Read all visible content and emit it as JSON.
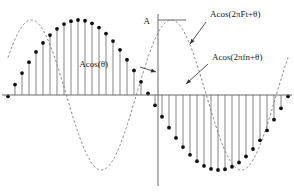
{
  "figure": {
    "title": "",
    "amplitude_label": "A",
    "labels": {
      "phase": "Acos(θ)",
      "continuous": "Acos(2πFt+θ)",
      "discrete": "Acos(2πfn+θ)"
    },
    "colors": {
      "axis": "#6b6b6b",
      "curve": "#777777",
      "stem": "#6f6f6f",
      "dot": "#111111",
      "leader": "#444444",
      "background": "#ffffff"
    }
  },
  "chart_data": {
    "type": "line",
    "title": "",
    "xlabel": "",
    "ylabel": "",
    "grid": false,
    "legend": false,
    "axes": {
      "x_axis_y_px": 95,
      "y_axis_x_px": 158,
      "amplitude_px": 75,
      "x_start_px": 8,
      "x_end_px": 288
    },
    "continuous": {
      "amplitude": 1.0,
      "cycles": 2.0,
      "phase_deg": -60,
      "n_points": 420
    },
    "samples": {
      "count": 41,
      "n": [
        -20,
        -19,
        -18,
        -17,
        -16,
        -15,
        -14,
        -13,
        -12,
        -11,
        -10,
        -9,
        -8,
        -7,
        -6,
        -5,
        -4,
        -3,
        -2,
        -1,
        0,
        1,
        2,
        3,
        4,
        5,
        6,
        7,
        8,
        9,
        10,
        11,
        12,
        13,
        14,
        15,
        16,
        17,
        18,
        19,
        20
      ],
      "values": [
        -0.017,
        0.139,
        0.292,
        0.438,
        0.574,
        0.695,
        0.799,
        0.883,
        0.946,
        0.985,
        1.0,
        0.99,
        0.956,
        0.899,
        0.819,
        0.719,
        0.602,
        0.47,
        0.327,
        0.176,
        0.02,
        -0.137,
        -0.29,
        -0.436,
        -0.573,
        -0.694,
        -0.798,
        -0.882,
        -0.945,
        -0.985,
        -1.0,
        -0.99,
        -0.957,
        -0.9,
        -0.82,
        -0.72,
        -0.604,
        -0.472,
        -0.329,
        -0.178,
        -0.018
      ]
    },
    "annotations": [
      {
        "name": "amplitude",
        "text": "A",
        "x_px": 150,
        "y_px": 20
      },
      {
        "name": "phase",
        "text": "Acos(θ)",
        "x_px": 108,
        "y_px": 63,
        "target_x_px": 158,
        "target_y_px": 72
      },
      {
        "name": "continuous",
        "text": "Acos(2πFt+θ)",
        "x_px": 210,
        "y_px": 13,
        "target_x_px": 190,
        "target_y_px": 44
      },
      {
        "name": "discrete",
        "text": "Acos(2πfn+θ)",
        "x_px": 212,
        "y_px": 56,
        "target_x_px": 186,
        "target_y_px": 84
      }
    ]
  }
}
